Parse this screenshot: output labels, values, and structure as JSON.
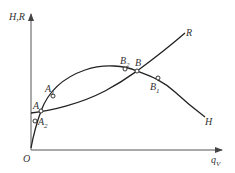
{
  "diagram": {
    "type": "pump-system characteristic curves",
    "axes": {
      "y_label": "H,R",
      "x_label": "q",
      "x_label_sub": "V",
      "origin_label": "O"
    },
    "curves": [
      {
        "name": "H",
        "label": "H",
        "description": "pump head curve (rises to a maximum then falls)"
      },
      {
        "name": "R",
        "label": "R",
        "description": "system resistance curve (monotonically rising)"
      }
    ],
    "points": [
      {
        "label": "A",
        "sub": "",
        "on": "intersection of H and R (low flow)"
      },
      {
        "label": "A",
        "sub": "1",
        "on": "H curve, above A"
      },
      {
        "label": "A",
        "sub": "2",
        "on": "H curve, below A"
      },
      {
        "label": "B",
        "sub": "",
        "on": "intersection of H and R (high flow)"
      },
      {
        "label": "B",
        "sub": "1",
        "on": "H curve, right of B"
      },
      {
        "label": "B",
        "sub": "2",
        "on": "H curve, left of B"
      }
    ],
    "colors": {
      "axis": "#555555",
      "curve": "#222222",
      "text": "#333333"
    }
  }
}
